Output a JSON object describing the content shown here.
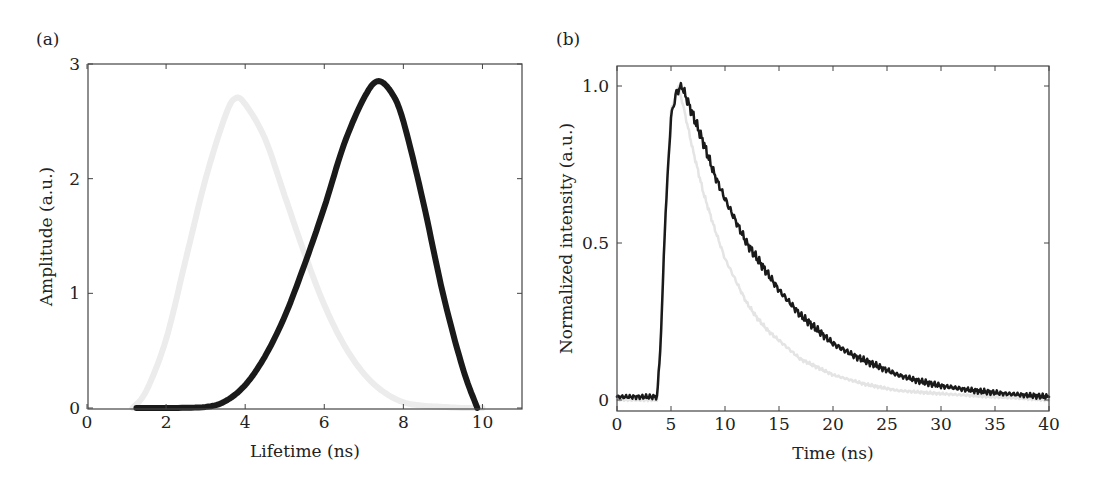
{
  "panels": {
    "a": {
      "label": "(a)"
    },
    "b": {
      "label": "(b)"
    }
  },
  "chart_data": [
    {
      "type": "line",
      "panel": "(a)",
      "title": "",
      "xlabel": "Lifetime (ns)",
      "ylabel": "Amplitude (a.u.)",
      "xlim": [
        0,
        11
      ],
      "ylim": [
        0,
        3
      ],
      "xticks": [
        0,
        2,
        4,
        6,
        8,
        10
      ],
      "yticks": [
        0,
        1,
        2,
        3
      ],
      "xtick_labels": [
        "0",
        "2",
        "4",
        "6",
        "8",
        "10"
      ],
      "ytick_labels": [
        "0",
        "1",
        "2",
        "3"
      ],
      "grid": false,
      "legend": null,
      "series": [
        {
          "name": "light gray distribution",
          "color": "#ececec",
          "line_width": 6,
          "x": [
            1.15,
            1.5,
            2.0,
            2.5,
            3.0,
            3.5,
            3.75,
            4.0,
            4.5,
            5.0,
            5.5,
            6.0,
            6.5,
            7.0,
            7.5,
            8.0,
            8.5,
            9.0,
            9.5,
            10.0
          ],
          "y": [
            0,
            0.15,
            0.6,
            1.3,
            2.0,
            2.55,
            2.7,
            2.65,
            2.35,
            1.85,
            1.35,
            0.9,
            0.55,
            0.3,
            0.14,
            0.05,
            0.02,
            0.01,
            0,
            0
          ]
        },
        {
          "name": "black distribution",
          "color": "#1a1a1a",
          "line_width": 6,
          "x": [
            1.25,
            2.0,
            3.0,
            3.5,
            4.0,
            4.5,
            5.0,
            5.5,
            6.0,
            6.5,
            7.0,
            7.35,
            7.7,
            8.0,
            8.5,
            9.0,
            9.5,
            9.87
          ],
          "y": [
            0,
            0,
            0.01,
            0.06,
            0.2,
            0.45,
            0.8,
            1.25,
            1.75,
            2.3,
            2.7,
            2.85,
            2.75,
            2.5,
            1.8,
            1.0,
            0.35,
            0
          ]
        }
      ]
    },
    {
      "type": "line",
      "panel": "(b)",
      "title": "",
      "xlabel": "Time (ns)",
      "ylabel": "Normalized intensity (a.u.)",
      "xlim": [
        0,
        40
      ],
      "ylim": [
        -0.03,
        1.05
      ],
      "xticks": [
        0,
        5,
        10,
        15,
        20,
        25,
        30,
        35,
        40
      ],
      "yticks": [
        0,
        0.5,
        1.0
      ],
      "xtick_labels": [
        "0",
        "5",
        "10",
        "15",
        "20",
        "25",
        "30",
        "35",
        "40"
      ],
      "ytick_labels": [
        "0",
        "0.5",
        "1.0"
      ],
      "grid": false,
      "legend": null,
      "series": [
        {
          "name": "light gray decay",
          "color": "#e4e4e4",
          "line_width": 2.5,
          "x": [
            0,
            3.7,
            4.0,
            4.5,
            5.0,
            5.7,
            6.5,
            7.0,
            8.0,
            9.0,
            10.0,
            11.0,
            12.0,
            13.0,
            14.0,
            15.0,
            17.0,
            20.0,
            23.0,
            26.0,
            30.0,
            35.0,
            40.0
          ],
          "y": [
            0,
            0,
            0.15,
            0.6,
            0.92,
            1.0,
            0.88,
            0.8,
            0.66,
            0.55,
            0.45,
            0.38,
            0.31,
            0.26,
            0.22,
            0.19,
            0.13,
            0.08,
            0.05,
            0.03,
            0.02,
            0.01,
            0
          ]
        },
        {
          "name": "black decay",
          "color": "#1a1a1a",
          "line_width": 2.5,
          "x": [
            0,
            3.7,
            4.0,
            4.5,
            5.0,
            5.5,
            6.0,
            7.0,
            8.0,
            9.0,
            10.0,
            11.0,
            12.0,
            13.0,
            14.0,
            15.0,
            16.0,
            17.0,
            18.0,
            19.0,
            20.0,
            22.0,
            24.0,
            26.0,
            28.0,
            30.0,
            33.0,
            36.0,
            40.0
          ],
          "y": [
            0.01,
            0.01,
            0.15,
            0.6,
            0.9,
            0.98,
            1.0,
            0.91,
            0.82,
            0.72,
            0.64,
            0.57,
            0.5,
            0.45,
            0.4,
            0.35,
            0.31,
            0.27,
            0.24,
            0.21,
            0.18,
            0.14,
            0.11,
            0.08,
            0.06,
            0.045,
            0.03,
            0.02,
            0.01
          ]
        }
      ]
    }
  ]
}
